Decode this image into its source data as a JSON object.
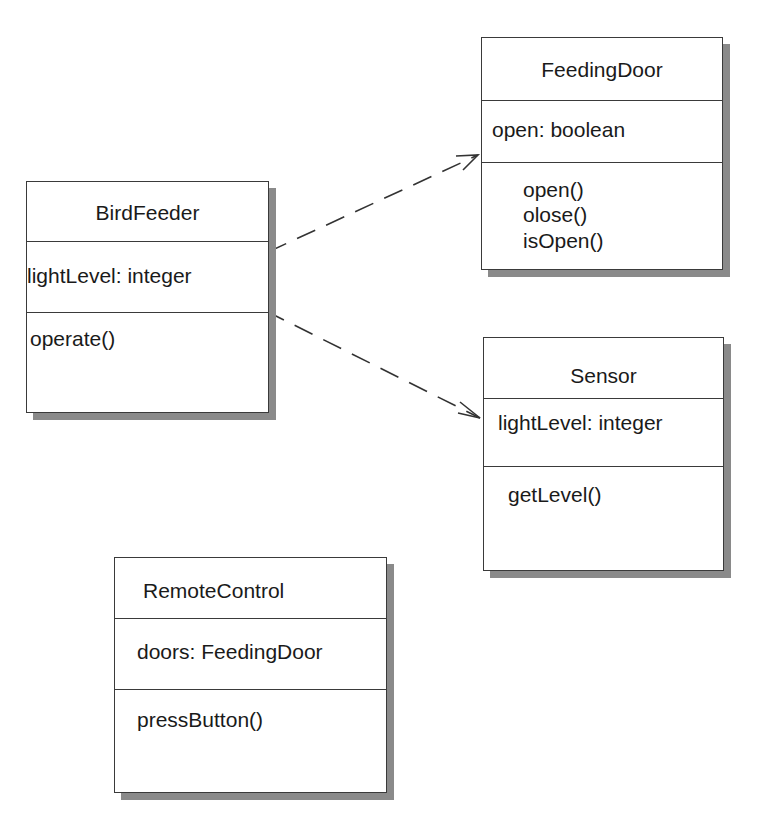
{
  "diagram": {
    "type": "UML class diagram",
    "classes": [
      {
        "name": "BirdFeeder",
        "attributes": [
          "lightLevel: integer"
        ],
        "operations": [
          "operate()"
        ]
      },
      {
        "name": "FeedingDoor",
        "attributes": [
          "open: boolean"
        ],
        "operations": [
          "open()",
          "olose()",
          "isOpen()"
        ]
      },
      {
        "name": "Sensor",
        "attributes": [
          "lightLevel: integer"
        ],
        "operations": [
          "getLevel()"
        ]
      },
      {
        "name": "RemoteControl",
        "attributes": [
          "doors: FeedingDoor"
        ],
        "operations": [
          "pressButton()"
        ]
      }
    ],
    "relationships": [
      {
        "from": "BirdFeeder",
        "to": "FeedingDoor",
        "style": "dashed",
        "head": "open-arrow"
      },
      {
        "from": "BirdFeeder",
        "to": "Sensor",
        "style": "dashed",
        "head": "open-arrow"
      }
    ]
  }
}
